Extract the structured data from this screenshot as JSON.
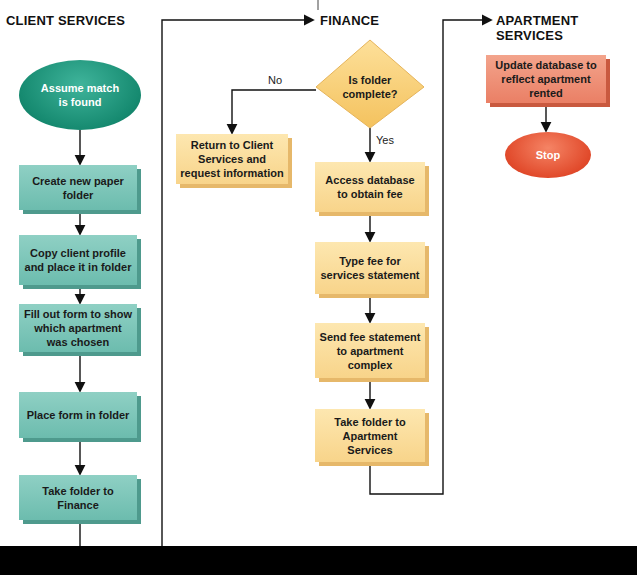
{
  "lanes": {
    "client_services": "CLIENT SERVICES",
    "finance": "FINANCE",
    "apartment_services": "APARTMENT SERVICES"
  },
  "client_services": {
    "start": "Assume match is found",
    "steps": [
      "Create new paper folder",
      "Copy client profile and place it in folder",
      "Fill out form to show which apartment was chosen",
      "Place form in folder",
      "Take folder to Finance"
    ]
  },
  "finance": {
    "decision": "Is folder complete?",
    "no_label": "No",
    "yes_label": "Yes",
    "no_action": "Return to Client Services and request information",
    "steps": [
      "Access database to obtain fee",
      "Type fee for services statement",
      "Send fee statement to apartment complex",
      "Take folder to Apartment Services"
    ]
  },
  "apartment_services": {
    "steps": [
      "Update database to reflect apartment rented"
    ],
    "end": "Stop"
  },
  "colors": {
    "client_box": "#7cc6b8",
    "finance_box": "#fbdc9c",
    "apartment_box": "#ee8e74",
    "start_oval": "#168a70",
    "stop_oval": "#e14a2b",
    "diamond": "#f8d27a",
    "footer": "#000000"
  }
}
